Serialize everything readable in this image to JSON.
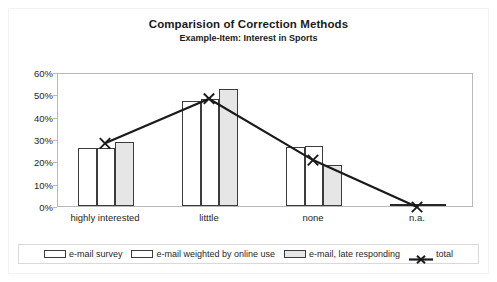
{
  "chart_data": {
    "type": "bar",
    "title": "Comparision of Correction Methods",
    "subtitle": "Example-Item: Interest in Sports",
    "xlabel": "",
    "ylabel": "",
    "ylim": [
      0,
      60
    ],
    "ytick_labels": [
      "0%",
      "10%",
      "20%",
      "30%",
      "40%",
      "50%",
      "60%"
    ],
    "ytick_values": [
      0,
      10,
      20,
      30,
      40,
      50,
      60
    ],
    "grid": false,
    "legend_position": "bottom",
    "categories": [
      "highly interested",
      "litttle",
      "none",
      "n.a."
    ],
    "series": [
      {
        "name": "e-mail survey",
        "type": "bar",
        "fill": "#ffffff",
        "values": [
          26.0,
          47.0,
          26.5,
          0.0
        ]
      },
      {
        "name": "e-mail weighted by online use",
        "type": "bar",
        "fill": "#ffffff",
        "values": [
          26.0,
          48.0,
          27.0,
          0.0
        ]
      },
      {
        "name": "e-mail, late responding",
        "type": "bar",
        "fill": "#e6e6e6",
        "values": [
          28.8,
          52.5,
          18.3,
          0.0
        ]
      },
      {
        "name": "total",
        "type": "line",
        "marker": "x",
        "color": "#1a1a1a",
        "values": [
          28.5,
          48.5,
          21.0,
          0.0
        ]
      }
    ]
  },
  "legend": {
    "items": [
      {
        "label": "e-mail survey",
        "marker": "bar-white"
      },
      {
        "label": "e-mail weighted by online use",
        "marker": "bar-white"
      },
      {
        "label": "e-mail, late responding",
        "marker": "bar-gray"
      },
      {
        "label": "total",
        "marker": "line-x"
      }
    ]
  },
  "colors": {
    "bar_border": "#3c3c3c",
    "bar_fill_light": "#ffffff",
    "bar_fill_gray": "#e6e6e6",
    "line": "#1a1a1a",
    "axis": "#b9b9b9",
    "text": "#262626",
    "background": "#ffffff"
  }
}
